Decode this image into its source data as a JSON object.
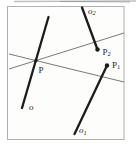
{
  "figure": {
    "type": "geometry-diagram",
    "description_visible_elements": "framed square diagram with three thick segments, two thin lines crossing at a point, three marked points",
    "colors": {
      "background": "#ffffff",
      "frame_border": "#b0b0b0",
      "ink": "#1c1c1c",
      "thin_line": "#575757",
      "scan_artifact": "#8a8a8a"
    },
    "labels": {
      "p": {
        "base": "P",
        "sub": "",
        "x": 38.5,
        "y": 73
      },
      "p1": {
        "base": "P",
        "sub": "1",
        "x": 112,
        "y": 67.5
      },
      "p2": {
        "base": "P",
        "sub": "2",
        "x": 102.5,
        "y": 54.5
      },
      "o": {
        "base": "o",
        "sub": "",
        "x": 29,
        "y": 110
      },
      "o1": {
        "base": "o",
        "sub": "1",
        "x": 79,
        "y": 133
      },
      "o2": {
        "base": "o",
        "sub": "2",
        "x": 88,
        "y": 13.5
      }
    },
    "geometry": {
      "frame": {
        "x": 7.5,
        "y": 6.5,
        "w": 116.5,
        "h": 133
      },
      "line1": {
        "x1": 9,
        "y1": 69,
        "x2": 124,
        "y2": 33
      },
      "line2": {
        "x1": 9,
        "y1": 54,
        "x2": 124,
        "y2": 82
      },
      "seg_o": {
        "x1": 48.5,
        "y1": 17,
        "x2": 22,
        "y2": 108
      },
      "seg_o1": {
        "x1": 107,
        "y1": 65.5,
        "x2": 74.5,
        "y2": 134
      },
      "seg_o2": {
        "x1": 82,
        "y1": 7.5,
        "x2": 97.5,
        "y2": 49.5
      },
      "pt_p": {
        "cx": 36,
        "cy": 60.5,
        "r": 1.7
      },
      "pt_p1": {
        "cx": 107,
        "cy": 65.5,
        "r": 2.2
      },
      "pt_p2": {
        "cx": 97.5,
        "cy": 49.5,
        "r": 2.2
      },
      "artifact_line": {
        "x1": 14,
        "y1": 1.5,
        "x2": 136,
        "y2": 1
      },
      "artifact_line2": {
        "x1": 60,
        "y1": 1.5,
        "x2": 130,
        "y2": 2
      },
      "speck": {
        "cx": 56,
        "cy": 11.5,
        "r": 0.9
      }
    }
  }
}
